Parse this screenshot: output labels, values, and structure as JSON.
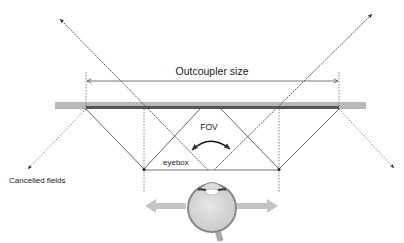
{
  "diagram": {
    "labels": {
      "outcoupler_size": "Outcoupler size",
      "fov": "FOV",
      "eyebox": "eyebox",
      "cancelled_fields": "Cancelled fields"
    },
    "colors": {
      "waveguide": "#b8b8b8",
      "outcoupler": "#555555",
      "lines": "#444444",
      "eye_fill": "#d9d9d9",
      "eye_stroke": "#8a8a8a",
      "arrows": "#bdbdbd"
    },
    "elements": [
      "waveguide-bar",
      "outcoupler-grating",
      "outcoupler-size-dimension",
      "field-rays",
      "cancelled-field-rays",
      "eyebox-segment",
      "fov-arc",
      "eye",
      "eye-movement-arrows"
    ]
  }
}
